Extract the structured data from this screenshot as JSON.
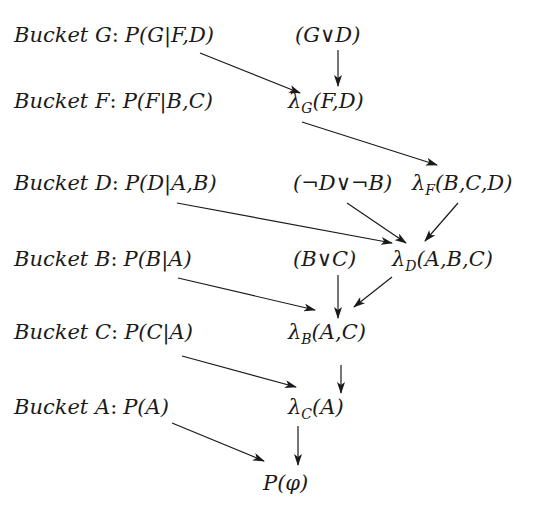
{
  "diagram": {
    "type": "bucket-elimination",
    "rows": [
      {
        "id": "G",
        "bucket_label": "Bucket G",
        "cpt": "P(G|F,D)",
        "cpt_head": "P(G",
        "cpt_tail": "F,D)",
        "extra": [
          {
            "id": "constraint-GvD",
            "text": "(G∨D)"
          }
        ]
      },
      {
        "id": "F",
        "bucket_label": "Bucket F",
        "cpt": "P(F|B,C)",
        "cpt_head": "P(F",
        "cpt_tail": "B,C)",
        "extra": [
          {
            "id": "lambda-G",
            "symbol": "λ",
            "sub": "G",
            "args": "(F,D)"
          }
        ]
      },
      {
        "id": "D",
        "bucket_label": "Bucket D",
        "cpt": "P(D|A,B)",
        "cpt_head": "P(D",
        "cpt_tail": "A,B)",
        "extra": [
          {
            "id": "constraint-notD-v-notB",
            "text": "(¬D∨¬B)"
          },
          {
            "id": "lambda-F",
            "symbol": "λ",
            "sub": "F",
            "args": "(B,C,D)"
          }
        ]
      },
      {
        "id": "B",
        "bucket_label": "Bucket B",
        "cpt": "P(B|A)",
        "cpt_head": "P(B",
        "cpt_tail": "A)",
        "extra": [
          {
            "id": "constraint-BvC",
            "text": "(B∨C)"
          },
          {
            "id": "lambda-D",
            "symbol": "λ",
            "sub": "D",
            "args": "(A,B,C)"
          }
        ]
      },
      {
        "id": "C",
        "bucket_label": "Bucket C",
        "cpt": "P(C|A)",
        "cpt_head": "P(C",
        "cpt_tail": "A)",
        "extra": [
          {
            "id": "lambda-B",
            "symbol": "λ",
            "sub": "B",
            "args": "(A,C)"
          }
        ]
      },
      {
        "id": "A",
        "bucket_label": "Bucket A",
        "cpt": "P(A)",
        "cpt_head": "P(A)",
        "cpt_tail": "",
        "extra": [
          {
            "id": "lambda-C",
            "symbol": "λ",
            "sub": "C",
            "args": "(A)"
          }
        ]
      }
    ],
    "result": {
      "text": "P(φ)"
    },
    "colon": ":",
    "bar": "|",
    "edges": [
      {
        "from": "P(G|F,D)",
        "to": "λG(F,D)"
      },
      {
        "from": "(G∨D)",
        "to": "λG(F,D)"
      },
      {
        "from": "λG(F,D)",
        "to": "λF(B,C,D)"
      },
      {
        "from": "P(D|A,B)",
        "to": "λD(A,B,C)"
      },
      {
        "from": "(¬D∨¬B)",
        "to": "λD(A,B,C)"
      },
      {
        "from": "λF(B,C,D)",
        "to": "λD(A,B,C)"
      },
      {
        "from": "P(B|A)",
        "to": "λB(A,C)"
      },
      {
        "from": "(B∨C)",
        "to": "λB(A,C)"
      },
      {
        "from": "λD(A,B,C)",
        "to": "λB(A,C)"
      },
      {
        "from": "P(C|A)",
        "to": "λC(A)"
      },
      {
        "from": "λB(A,C)",
        "to": "λC(A)"
      },
      {
        "from": "P(A)",
        "to": "P(φ)"
      },
      {
        "from": "λC(A)",
        "to": "P(φ)"
      }
    ]
  }
}
